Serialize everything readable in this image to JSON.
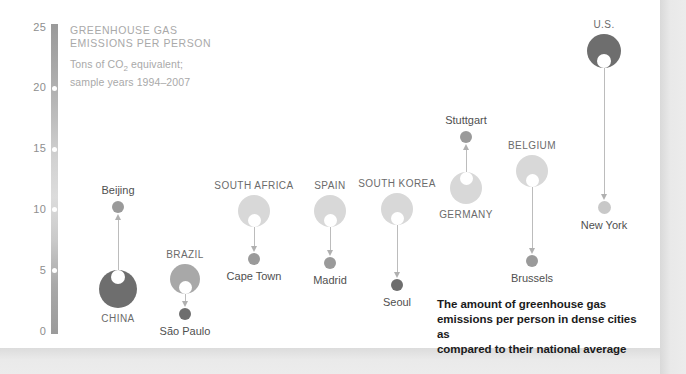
{
  "legend": {
    "title_line1": "GREENHOUSE GAS",
    "title_line2": "EMISSIONS PER PERSON",
    "sub_line1_pre": "Tons of CO",
    "sub_line1_sub": "2",
    "sub_line1_post": " equivalent;",
    "sub_line2": "sample years 1994–2007"
  },
  "caption": {
    "line1": "The amount of greenhouse gas",
    "line2": "emissions per person in dense cities as",
    "line3": "compared to their national average"
  },
  "axis": {
    "ticks": [
      "25",
      "20",
      "15",
      "10",
      "5",
      "0"
    ]
  },
  "colors": {
    "country_dark": "#6e6e6e",
    "country_mid": "#a8a8a8",
    "country_light": "#d8d8d8",
    "city_dark": "#6e6e6e",
    "city_mid": "#9a9a9a",
    "city_light": "#c8c8c8",
    "stem": "#bcbcbc",
    "panel": "#ffffff",
    "axis_tick_text": "#8e8e8e",
    "caption_text": "#1b1b1b"
  },
  "chart_data": {
    "type": "scatter",
    "title": "GREENHOUSE GAS EMISSIONS PER PERSON",
    "subtitle": "Tons of CO2 equivalent; sample years 1994–2007",
    "xlabel": "",
    "ylabel": "Tons of CO2 equivalent per person",
    "ylim": [
      0,
      25
    ],
    "yticks": [
      0,
      5,
      10,
      15,
      20,
      25
    ],
    "grid": false,
    "legend_position": "none",
    "annotation": "The amount of greenhouse gas emissions per person in dense cities as compared to their national average",
    "pairs": [
      {
        "country": "CHINA",
        "country_value": 3.5,
        "city": "Beijing",
        "city_value": 10.2,
        "direction": "up",
        "country_label_position": "below",
        "city_label_position": "above"
      },
      {
        "country": "BRAZIL",
        "country_value": 4.3,
        "city": "São Paulo",
        "city_value": 1.4,
        "direction": "down",
        "country_label_position": "above",
        "city_label_position": "below"
      },
      {
        "country": "SOUTH AFRICA",
        "country_value": 9.9,
        "city": "Cape Town",
        "city_value": 6.0,
        "direction": "down",
        "country_label_position": "above",
        "city_label_position": "below"
      },
      {
        "country": "SPAIN",
        "country_value": 9.9,
        "city": "Madrid",
        "city_value": 5.6,
        "direction": "down",
        "country_label_position": "above",
        "city_label_position": "below"
      },
      {
        "country": "SOUTH KOREA",
        "country_value": 10.1,
        "city": "Seoul",
        "city_value": 3.8,
        "direction": "down",
        "country_label_position": "above",
        "city_label_position": "below"
      },
      {
        "country": "GERMANY",
        "country_value": 11.8,
        "city": "Stuttgart",
        "city_value": 16.0,
        "direction": "up",
        "country_label_position": "below",
        "city_label_position": "above"
      },
      {
        "country": "BELGIUM",
        "country_value": 13.2,
        "city": "Brussels",
        "city_value": 5.8,
        "direction": "down",
        "country_label_position": "above",
        "city_label_position": "below"
      },
      {
        "country": "U.S.",
        "country_value": 23.1,
        "city": "New York",
        "city_value": 10.2,
        "direction": "down",
        "country_label_position": "above",
        "city_label_position": "below"
      }
    ]
  }
}
